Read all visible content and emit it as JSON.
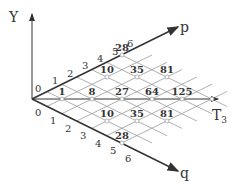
{
  "diagram": {
    "axes": {
      "y_label": "Y",
      "p_label": "p",
      "q_label": "q",
      "t_label": "T",
      "t_subscript": "3"
    },
    "p_ticks": [
      "0",
      "1",
      "2",
      "3",
      "4",
      "5",
      "6"
    ],
    "q_ticks": [
      "0",
      "1",
      "2",
      "3",
      "4",
      "5",
      "6"
    ],
    "node_values": {
      "t_row": [
        "1",
        "8",
        "27",
        "64",
        "125"
      ],
      "upper_row1": [
        "10",
        "35",
        "81"
      ],
      "upper_row2": [
        "28"
      ],
      "lower_row1": [
        "10",
        "35",
        "81"
      ],
      "lower_row2": [
        "28"
      ]
    },
    "colors": {
      "axis": "#333333",
      "grid": "#9a9a9a",
      "text": "#333333"
    }
  }
}
